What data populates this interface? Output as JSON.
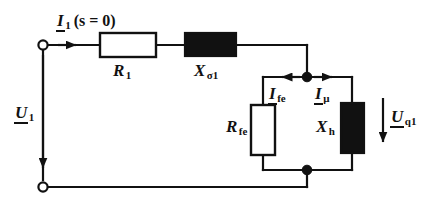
{
  "diagram": {
    "background_color": "#ffffff",
    "line_color": "#111111",
    "fill_color": "#111111",
    "type": "electrical-circuit-schematic"
  },
  "labels": {
    "current_input": {
      "symbol": "I",
      "subscript": "1",
      "suffix": "(s = 0)",
      "full": "I1(s = 0)"
    },
    "voltage_input": {
      "symbol": "U",
      "subscript": "1",
      "full": "U1"
    },
    "resistor_stator": {
      "symbol": "R",
      "subscript": "1",
      "full": "R1"
    },
    "reactance_leakage": {
      "symbol": "X",
      "subscript": "σ1",
      "full": "Xσ1"
    },
    "resistor_iron": {
      "symbol": "R",
      "subscript": "fe",
      "full": "Rfe"
    },
    "reactance_main": {
      "symbol": "X",
      "subscript": "h",
      "full": "Xh"
    },
    "current_iron": {
      "symbol": "I",
      "subscript": "fe",
      "full": "Ife"
    },
    "current_magnetizing": {
      "symbol": "I",
      "subscript": "μ",
      "full": "Iμ"
    },
    "voltage_induced": {
      "symbol": "U",
      "subscript": "q1",
      "full": "Uq1"
    }
  },
  "components": [
    {
      "name": "resistor-r1",
      "kind": "resistor",
      "style": "open-rectangle",
      "label": "R1"
    },
    {
      "name": "reactance-xsigma1",
      "kind": "reactance",
      "style": "filled-rectangle",
      "label": "Xσ1"
    },
    {
      "name": "resistor-rfe",
      "kind": "resistor",
      "style": "open-rectangle",
      "label": "Rfe"
    },
    {
      "name": "reactance-xh",
      "kind": "reactance",
      "style": "filled-rectangle",
      "label": "Xh"
    }
  ],
  "terminals": [
    {
      "name": "terminal-top-left",
      "style": "open-circle"
    },
    {
      "name": "terminal-bottom-left",
      "style": "open-circle"
    }
  ],
  "junctions": [
    {
      "name": "junction-top",
      "style": "filled-dot"
    },
    {
      "name": "junction-bottom",
      "style": "filled-dot"
    }
  ],
  "arrows": [
    {
      "name": "arrow-i1",
      "direction": "right",
      "label": "I1(s = 0)"
    },
    {
      "name": "arrow-u1",
      "direction": "down",
      "label": "U1"
    },
    {
      "name": "arrow-ife",
      "direction": "left",
      "label": "Ife"
    },
    {
      "name": "arrow-imu",
      "direction": "right",
      "label": "Iμ"
    },
    {
      "name": "arrow-uq1",
      "direction": "down",
      "label": "Uq1"
    }
  ]
}
